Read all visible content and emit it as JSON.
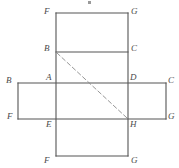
{
  "figure": {
    "name": "cube-net-diagram",
    "kind": "geometric-net",
    "canvas": {
      "width": 179,
      "height": 168
    },
    "colors": {
      "background": "#ffffff",
      "stroke": "#555555",
      "dashed_stroke": "#8a8a8a",
      "label_text": "#4a4a4a"
    },
    "stroke_width": 1.1,
    "dash_pattern": "4 3"
  },
  "geometry": {
    "column_left_x": 56,
    "column_right_x": 128,
    "bar_left_x": 18,
    "bar_right_x": 166,
    "y_top": 13,
    "y_bc": 52,
    "y_ad": 83,
    "y_eh": 119,
    "y_bottom": 156
  },
  "faces": [
    {
      "id": "face-top",
      "name": "upper-face-FGCB",
      "x": 56,
      "y": 13,
      "w": 72,
      "h": 39
    },
    {
      "id": "face-upper-mid",
      "name": "face-BCDA",
      "x": 56,
      "y": 52,
      "w": 72,
      "h": 31
    },
    {
      "id": "face-left",
      "name": "left-face-BAEF",
      "x": 18,
      "y": 83,
      "w": 38,
      "h": 36
    },
    {
      "id": "face-center",
      "name": "center-face-ADHE",
      "x": 56,
      "y": 83,
      "w": 72,
      "h": 36
    },
    {
      "id": "face-right",
      "name": "right-face-DCGH",
      "x": 128,
      "y": 83,
      "w": 38,
      "h": 36
    },
    {
      "id": "face-bottom",
      "name": "lower-face-EHGF",
      "x": 56,
      "y": 119,
      "w": 72,
      "h": 37
    }
  ],
  "edges": {
    "solid": [
      {
        "name": "edge-top-FG",
        "x1": 56,
        "y1": 13,
        "x2": 128,
        "y2": 13
      },
      {
        "name": "edge-BC",
        "x1": 56,
        "y1": 52,
        "x2": 128,
        "y2": 52
      },
      {
        "name": "edge-AD-row",
        "x1": 18,
        "y1": 83,
        "x2": 166,
        "y2": 83
      },
      {
        "name": "edge-EH-row",
        "x1": 18,
        "y1": 119,
        "x2": 166,
        "y2": 119
      },
      {
        "name": "edge-bottom-FG",
        "x1": 56,
        "y1": 156,
        "x2": 128,
        "y2": 156
      },
      {
        "name": "edge-column-left",
        "x1": 56,
        "y1": 13,
        "x2": 56,
        "y2": 156
      },
      {
        "name": "edge-column-right",
        "x1": 128,
        "y1": 13,
        "x2": 128,
        "y2": 156
      },
      {
        "name": "edge-bar-left",
        "x1": 18,
        "y1": 83,
        "x2": 18,
        "y2": 119
      },
      {
        "name": "edge-bar-right",
        "x1": 166,
        "y1": 83,
        "x2": 166,
        "y2": 119
      }
    ],
    "dashed": [
      {
        "name": "diagonal-B-to-H",
        "x1": 57,
        "y1": 53,
        "x2": 127,
        "y2": 118
      }
    ]
  },
  "vertex_labels": [
    {
      "name": "label-F-top-left",
      "text": "F",
      "x": 44,
      "y": 7,
      "anchor": "topleft"
    },
    {
      "name": "label-G-top-right",
      "text": "G",
      "x": 131,
      "y": 7,
      "anchor": "topleft"
    },
    {
      "name": "label-B-mid-left",
      "text": "B",
      "x": 44,
      "y": 44,
      "anchor": "topleft"
    },
    {
      "name": "label-C-mid-right",
      "text": "C",
      "x": 131,
      "y": 44,
      "anchor": "topleft"
    },
    {
      "name": "label-A-center-left",
      "text": "A",
      "x": 46,
      "y": 73,
      "anchor": "topleft"
    },
    {
      "name": "label-D-center-right",
      "text": "D",
      "x": 130,
      "y": 73,
      "anchor": "topleft"
    },
    {
      "name": "label-B-far-left",
      "text": "B",
      "x": 6,
      "y": 76,
      "anchor": "topleft"
    },
    {
      "name": "label-C-far-right",
      "text": "C",
      "x": 168,
      "y": 76,
      "anchor": "topleft"
    },
    {
      "name": "label-F-far-left",
      "text": "F",
      "x": 7,
      "y": 112,
      "anchor": "topleft"
    },
    {
      "name": "label-G-far-right",
      "text": "G",
      "x": 168,
      "y": 112,
      "anchor": "topleft"
    },
    {
      "name": "label-E-center-left",
      "text": "E",
      "x": 46,
      "y": 120,
      "anchor": "topleft"
    },
    {
      "name": "label-H-center-right",
      "text": "H",
      "x": 130,
      "y": 120,
      "anchor": "topleft"
    },
    {
      "name": "label-F-bottom-left",
      "text": "F",
      "x": 44,
      "y": 156,
      "anchor": "topleft"
    },
    {
      "name": "label-G-bottom-right",
      "text": "G",
      "x": 131,
      "y": 156,
      "anchor": "topleft"
    }
  ],
  "artifacts": [
    {
      "name": "scan-speck-top",
      "x": 88,
      "y": 1,
      "w": 3,
      "h": 3,
      "color": "#9a9a9a"
    }
  ]
}
